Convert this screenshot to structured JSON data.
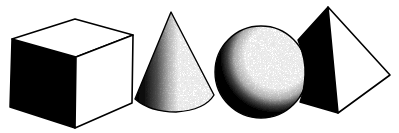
{
  "image": {
    "width": 399,
    "height": 133,
    "background": "#ffffff",
    "ink": "#000000"
  },
  "shapes": [
    {
      "id": "cube",
      "label": "Cube",
      "shading": "left face solid black, top and right faces white"
    },
    {
      "id": "cone",
      "label": "Cone",
      "shading": "left side stippled gradient, right side white"
    },
    {
      "id": "sphere",
      "label": "Sphere",
      "shading": "stippled crescent shadow on left and bottom"
    },
    {
      "id": "pyramid",
      "label": "Pyramid",
      "shading": "left face solid black, right face white"
    }
  ]
}
